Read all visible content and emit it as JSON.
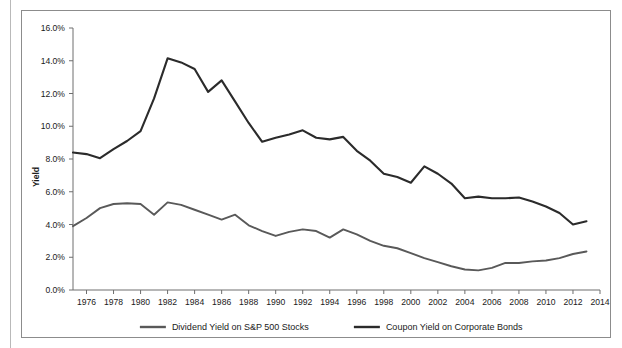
{
  "figure": {
    "frame_color": "#8c8c8c",
    "background": "#ffffff"
  },
  "chart_data": {
    "type": "line",
    "title": "",
    "subtitle": "",
    "xlabel": "",
    "ylabel": "Yield",
    "xlim": [
      1975,
      2014
    ],
    "ylim": [
      0,
      16
    ],
    "y_tick_labels": [
      "0.0%",
      "2.0%",
      "4.0%",
      "6.0%",
      "8.0%",
      "10.0%",
      "12.0%",
      "14.0%",
      "16.0%"
    ],
    "y_ticks": [
      0,
      2,
      4,
      6,
      8,
      10,
      12,
      14,
      16
    ],
    "x_tick_labels": [
      "1976",
      "1978",
      "1980",
      "1982",
      "1984",
      "1986",
      "1988",
      "1990",
      "1992",
      "1994",
      "1996",
      "1998",
      "2000",
      "2002",
      "2004",
      "2006",
      "2008",
      "2010",
      "2012",
      "2014"
    ],
    "x_ticks": [
      1976,
      1978,
      1980,
      1982,
      1984,
      1986,
      1988,
      1990,
      1992,
      1994,
      1996,
      1998,
      2000,
      2002,
      2004,
      2006,
      2008,
      2010,
      2012,
      2014
    ],
    "x": [
      1975,
      1976,
      1977,
      1978,
      1979,
      1980,
      1981,
      1982,
      1983,
      1984,
      1985,
      1986,
      1987,
      1988,
      1989,
      1990,
      1991,
      1992,
      1993,
      1994,
      1995,
      1996,
      1997,
      1998,
      1999,
      2000,
      2001,
      2002,
      2003,
      2004,
      2005,
      2006,
      2007,
      2008,
      2009,
      2010,
      2011,
      2012,
      2013
    ],
    "grid": false,
    "legend_position": "bottom",
    "series": [
      {
        "name": "Dividend Yield on S&P 500 Stocks",
        "color": "#595959",
        "values": [
          3.9,
          4.4,
          5.0,
          5.25,
          5.3,
          5.25,
          4.6,
          5.35,
          5.2,
          4.9,
          4.6,
          4.3,
          4.6,
          3.95,
          3.6,
          3.3,
          3.55,
          3.7,
          3.6,
          3.2,
          3.7,
          3.4,
          3.0,
          2.7,
          2.55,
          2.25,
          1.95,
          1.7,
          1.45,
          1.25,
          1.2,
          1.35,
          1.65,
          1.65,
          1.75,
          1.8,
          1.95,
          2.2,
          2.35
        ]
      },
      {
        "name": "Coupon Yield on Corporate Bonds",
        "color": "#2b2b2b",
        "values": [
          8.4,
          8.3,
          8.05,
          8.6,
          9.1,
          9.7,
          11.7,
          14.15,
          13.9,
          13.5,
          12.1,
          12.8,
          11.5,
          10.2,
          9.05,
          9.3,
          9.5,
          9.75,
          9.3,
          9.2,
          9.35,
          8.5,
          7.9,
          7.1,
          6.9,
          6.55,
          7.55,
          7.1,
          6.5,
          5.6,
          5.7,
          5.6,
          5.6,
          5.65,
          5.4,
          5.1,
          4.7,
          4.0,
          4.2
        ]
      }
    ]
  },
  "legend": {
    "items": [
      {
        "label": "Dividend Yield on S&P 500 Stocks",
        "color": "#595959"
      },
      {
        "label": "Coupon Yield on Corporate Bonds",
        "color": "#2b2b2b"
      }
    ]
  }
}
